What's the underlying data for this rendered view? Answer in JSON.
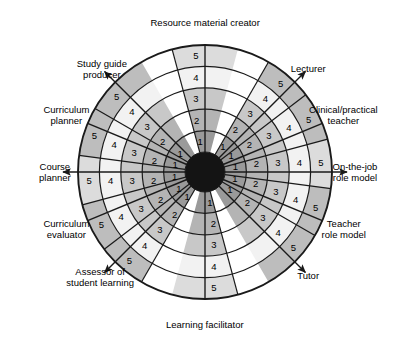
{
  "figure": {
    "type": "radar-wheel-diagram",
    "title": "",
    "center": {
      "x": 205,
      "y": 172
    },
    "outer_radius": 127,
    "core_radius": 20,
    "ring_count": 5,
    "scale_min": 1,
    "scale_max": 5,
    "scale_labels": [
      "1",
      "2",
      "3",
      "4",
      "5"
    ],
    "colors": {
      "background": "#ffffff",
      "stroke": "#1a1a1a",
      "core": "#141414",
      "ring1": "#9a9a9a",
      "ring2": "#b4b4b4",
      "ring3": "#c8c8c8",
      "ring4": "#f2f2f2",
      "ring5_dark": "#bdbdbd",
      "ring5_light": "#dcdcdc",
      "text": "#000000"
    }
  },
  "axes": [
    {
      "id": "resource-material-creator",
      "label": "Resource material creator",
      "angle_deg": 270,
      "direction": "up",
      "arrow": false,
      "sector_shade": "light",
      "scale_values": [
        "1",
        "2",
        "3",
        "4",
        "5"
      ]
    },
    {
      "id": "lecturer",
      "label": "Lecturer",
      "angle_deg": 315,
      "direction": "up-right",
      "arrow": true,
      "sector_shade": "dark",
      "scale_values": [
        "1",
        "2",
        "3",
        "4",
        "5"
      ]
    },
    {
      "id": "clinical-practical-teacher",
      "label": "Clinical/practical\nteacher",
      "angle_deg": 337.5,
      "direction": "up-right-outer",
      "arrow": false,
      "sector_shade": "dark",
      "scale_values": [
        "1",
        "2",
        "3",
        "4",
        "5"
      ]
    },
    {
      "id": "on-the-job-role-model",
      "label": "On-the-job\nrole model",
      "angle_deg": 0,
      "direction": "right",
      "arrow": true,
      "sector_shade": "light",
      "scale_values": [
        "1",
        "2",
        "3",
        "4",
        "5"
      ]
    },
    {
      "id": "teacher-role-model",
      "label": "Teacher\nrole model",
      "angle_deg": 22.5,
      "direction": "down-right-outer",
      "arrow": false,
      "sector_shade": "dark",
      "scale_values": [
        "1",
        "2",
        "3",
        "4",
        "5"
      ]
    },
    {
      "id": "tutor",
      "label": "Tutor",
      "angle_deg": 45,
      "direction": "down-right",
      "arrow": true,
      "sector_shade": "dark",
      "scale_values": [
        "1",
        "2",
        "3",
        "4",
        "5"
      ]
    },
    {
      "id": "learning-facilitator",
      "label": "Learning facilitator",
      "angle_deg": 90,
      "direction": "down",
      "arrow": false,
      "sector_shade": "light",
      "scale_values": [
        "1",
        "2",
        "3",
        "4",
        "5"
      ]
    },
    {
      "id": "assessor-of-student-learning",
      "label": "Assessor of\nstudent learning",
      "angle_deg": 135,
      "direction": "down-left",
      "arrow": true,
      "sector_shade": "dark",
      "scale_values": [
        "1",
        "2",
        "3",
        "4",
        "5"
      ]
    },
    {
      "id": "curriculum-evaluator",
      "label": "Curriculum\nevaluator",
      "angle_deg": 157.5,
      "direction": "down-left-outer",
      "arrow": false,
      "sector_shade": "dark",
      "scale_values": [
        "1",
        "2",
        "3",
        "4",
        "5"
      ]
    },
    {
      "id": "course-planner",
      "label": "Course\nplanner",
      "angle_deg": 180,
      "direction": "left",
      "arrow": true,
      "sector_shade": "light",
      "scale_values": [
        "1",
        "2",
        "3",
        "4",
        "5"
      ]
    },
    {
      "id": "curriculum-planner",
      "label": "Curriculum\nplanner",
      "angle_deg": 202.5,
      "direction": "up-left-outer",
      "arrow": false,
      "sector_shade": "dark",
      "scale_values": [
        "1",
        "2",
        "3",
        "4",
        "5"
      ]
    },
    {
      "id": "study-guide-producer",
      "label": "Study guide\nproducer",
      "angle_deg": 225,
      "direction": "up-left",
      "arrow": true,
      "sector_shade": "dark",
      "scale_values": [
        "1",
        "2",
        "3",
        "4",
        "5"
      ]
    }
  ],
  "chart_data": {
    "type": "radar",
    "categories": [
      "Resource material creator",
      "Lecturer",
      "Clinical/practical teacher",
      "On-the-job role model",
      "Teacher role model",
      "Tutor",
      "Learning facilitator",
      "Assessor of student learning",
      "Curriculum evaluator",
      "Course planner",
      "Curriculum planner",
      "Study guide producer"
    ],
    "rlim": [
      0,
      5
    ],
    "rticks": [
      1,
      2,
      3,
      4,
      5
    ],
    "grid": true,
    "legend": "none",
    "series": []
  }
}
